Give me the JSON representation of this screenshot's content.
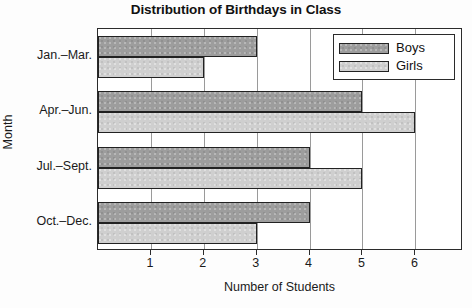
{
  "chart_data": {
    "type": "bar",
    "orientation": "horizontal",
    "title": "Distribution of Birthdays in Class",
    "xlabel": "Number of Students",
    "ylabel": "Month",
    "categories": [
      "Jan.–Mar.",
      "Apr.–Jun.",
      "Jul.–Sept.",
      "Oct.–Dec."
    ],
    "series": [
      {
        "name": "Boys",
        "color": "#9d9d9d",
        "values": [
          3,
          5,
          4,
          4
        ]
      },
      {
        "name": "Girls",
        "color": "#cfcfcf",
        "values": [
          2,
          6,
          5,
          3
        ]
      }
    ],
    "xlim": [
      0,
      6.9
    ],
    "xticks": [
      1,
      2,
      3,
      4,
      5,
      6
    ],
    "xtick_labels": [
      "1",
      "2",
      "3",
      "4",
      "5",
      "6"
    ],
    "grid": "vertical",
    "legend_position": "top-right",
    "legend_entries": [
      "Boys",
      "Girls"
    ]
  },
  "legend": {
    "boys_label": "Boys",
    "girls_label": "Girls"
  }
}
